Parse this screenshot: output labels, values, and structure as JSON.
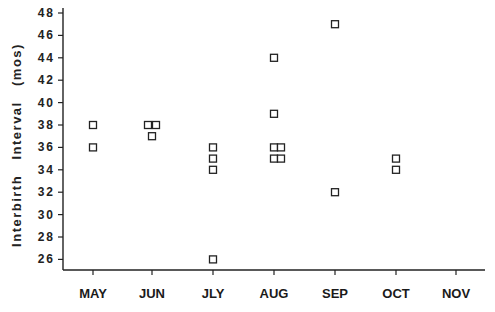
{
  "chart_data": {
    "type": "scatter",
    "title": "",
    "xlabel": "",
    "ylabel": "Interbirth   Interval   (mos)",
    "categories": [
      "MAY",
      "JUN",
      "JLY",
      "AUG",
      "SEP",
      "OCT",
      "NOV"
    ],
    "ylim": [
      25,
      48
    ],
    "yticks": [
      26,
      28,
      30,
      32,
      34,
      36,
      38,
      40,
      42,
      44,
      46,
      48
    ],
    "grid": false,
    "legend": null,
    "marker": "open-square",
    "points": [
      {
        "x": "MAY",
        "y": 38,
        "offset": 0
      },
      {
        "x": "MAY",
        "y": 36,
        "offset": 0
      },
      {
        "x": "JUN",
        "y": 38,
        "offset": -4
      },
      {
        "x": "JUN",
        "y": 38,
        "offset": 4
      },
      {
        "x": "JUN",
        "y": 37,
        "offset": 0
      },
      {
        "x": "JLY",
        "y": 36,
        "offset": 0
      },
      {
        "x": "JLY",
        "y": 35,
        "offset": 0
      },
      {
        "x": "JLY",
        "y": 34,
        "offset": 0
      },
      {
        "x": "JLY",
        "y": 26,
        "offset": 0
      },
      {
        "x": "AUG",
        "y": 44,
        "offset": 0
      },
      {
        "x": "AUG",
        "y": 39,
        "offset": 0
      },
      {
        "x": "AUG",
        "y": 36,
        "offset": 0
      },
      {
        "x": "AUG",
        "y": 36,
        "offset": 7
      },
      {
        "x": "AUG",
        "y": 35,
        "offset": 0
      },
      {
        "x": "AUG",
        "y": 35,
        "offset": 7
      },
      {
        "x": "SEP",
        "y": 47,
        "offset": 0
      },
      {
        "x": "SEP",
        "y": 32,
        "offset": 0
      },
      {
        "x": "OCT",
        "y": 35,
        "offset": 0
      },
      {
        "x": "OCT",
        "y": 34,
        "offset": 0
      }
    ]
  }
}
